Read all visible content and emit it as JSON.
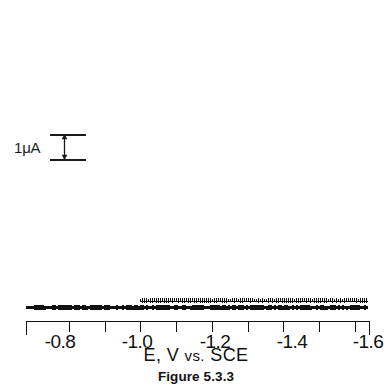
{
  "figure": {
    "caption": "Figure 5.3.3",
    "x_axis_title_main": "E, V",
    "x_axis_title_vs": "vs.",
    "x_axis_title_ref": "SCE",
    "scale_bar_label": "1μA",
    "ink_color": "#111111"
  },
  "chart_data": {
    "type": "line",
    "title": "Figure 5.3.3",
    "subtitle": "",
    "xlabel": "E, V vs. SCE",
    "ylabel": "i",
    "ylabel_units": "μA",
    "xlim": [
      -0.68,
      -1.64
    ],
    "ylim": [
      0,
      7.6
    ],
    "grid": false,
    "legend": "none",
    "x_tick_labels": [
      "-0.8",
      "-1.0",
      "-1.2",
      "-1.4",
      "-1.6"
    ],
    "x_tick_values": [
      -0.8,
      -1.0,
      -1.2,
      -1.4,
      -1.6
    ],
    "x_tick_px": [
      60,
      137,
      215,
      292,
      368
    ],
    "x_minor_tick_values": [
      -0.9,
      -1.1,
      -1.3,
      -1.5
    ],
    "y_scale_bar": {
      "value": 1,
      "units": "μA",
      "label": "1μA",
      "pixel_height": 25
    },
    "annotations": [
      {
        "text": "1μA",
        "type": "current-scale-bar",
        "x": -0.74,
        "y": 4.3
      }
    ],
    "series": [
      {
        "name": "polarographic wave (drop-oscillation envelope, maxima)",
        "style": "oscillating dc polarogram",
        "x": [
          -0.68,
          -0.72,
          -0.76,
          -0.8,
          -0.84,
          -0.88,
          -0.9,
          -0.92,
          -0.94,
          -0.96,
          -0.98,
          -1.0,
          -1.02,
          -1.04,
          -1.06,
          -1.08,
          -1.1,
          -1.12,
          -1.14,
          -1.16,
          -1.2,
          -1.24,
          -1.28,
          -1.32,
          -1.36,
          -1.4,
          -1.44,
          -1.48,
          -1.52,
          -1.56,
          -1.6,
          -1.64
        ],
        "values": [
          0.28,
          0.3,
          0.33,
          0.38,
          0.5,
          0.78,
          1.0,
          1.35,
          1.8,
          2.35,
          2.95,
          3.6,
          4.25,
          4.85,
          5.35,
          5.75,
          6.05,
          6.3,
          6.5,
          6.65,
          6.85,
          6.95,
          7.02,
          7.08,
          7.14,
          7.2,
          7.25,
          7.3,
          7.34,
          7.38,
          7.42,
          7.45
        ]
      },
      {
        "name": "residual / charging current baseline (drop minima)",
        "style": "oscillating baseline",
        "x": [
          -0.68,
          -0.76,
          -0.84,
          -0.92,
          -1.0,
          -1.08,
          -1.16,
          -1.24,
          -1.32,
          -1.4,
          -1.48,
          -1.56,
          -1.64
        ],
        "values": [
          0.18,
          0.2,
          0.22,
          0.25,
          0.28,
          0.3,
          0.33,
          0.36,
          0.39,
          0.42,
          0.46,
          0.5,
          0.55
        ]
      },
      {
        "name": "supporting-electrolyte residual trace (second scan, begins at -1.00 V)",
        "style": "oscillating baseline offset",
        "x": [
          -1.0,
          -1.08,
          -1.16,
          -1.24,
          -1.32,
          -1.4,
          -1.48,
          -1.56,
          -1.64
        ],
        "values": [
          0.46,
          0.48,
          0.5,
          0.53,
          0.56,
          0.6,
          0.64,
          0.68,
          0.72
        ]
      }
    ]
  },
  "x_ticks": [
    {
      "label": "-0.8",
      "x_px": 60
    },
    {
      "label": "-1.0",
      "x_px": 137
    },
    {
      "label": "-1.2",
      "x_px": 215
    },
    {
      "label": "-1.4",
      "x_px": 292
    },
    {
      "label": "-1.6",
      "x_px": 368
    }
  ]
}
